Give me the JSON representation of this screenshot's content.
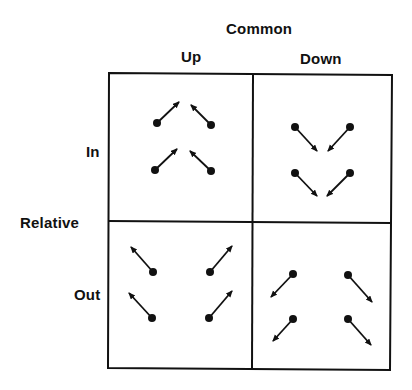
{
  "title": "Common",
  "columns": [
    {
      "label": "Up"
    },
    {
      "label": "Down"
    }
  ],
  "row_axis_label": "Relative",
  "rows": [
    {
      "label": "In"
    },
    {
      "label": "Out"
    }
  ],
  "colors": {
    "ink": "#111111",
    "background": "#ffffff"
  },
  "quadrants": [
    {
      "name": "common-up-relative-in",
      "vectors": [
        {
          "from": [
            157,
            123
          ],
          "to": [
            179,
            102
          ]
        },
        {
          "from": [
            211,
            125
          ],
          "to": [
            191,
            105
          ]
        },
        {
          "from": [
            155,
            170
          ],
          "to": [
            177,
            149
          ]
        },
        {
          "from": [
            211,
            171
          ],
          "to": [
            190,
            151
          ]
        }
      ]
    },
    {
      "name": "common-down-relative-in",
      "vectors": [
        {
          "from": [
            295,
            127
          ],
          "to": [
            317,
            151
          ]
        },
        {
          "from": [
            350,
            127
          ],
          "to": [
            328,
            151
          ]
        },
        {
          "from": [
            295,
            173
          ],
          "to": [
            317,
            196
          ]
        },
        {
          "from": [
            350,
            173
          ],
          "to": [
            327,
            196
          ]
        }
      ]
    },
    {
      "name": "common-up-relative-out",
      "vectors": [
        {
          "from": [
            153,
            272
          ],
          "to": [
            131,
            247
          ]
        },
        {
          "from": [
            210,
            272
          ],
          "to": [
            232,
            246
          ]
        },
        {
          "from": [
            152,
            318
          ],
          "to": [
            129,
            293
          ]
        },
        {
          "from": [
            209,
            318
          ],
          "to": [
            232,
            291
          ]
        }
      ]
    },
    {
      "name": "common-down-relative-out",
      "vectors": [
        {
          "from": [
            293,
            274
          ],
          "to": [
            271,
            297
          ]
        },
        {
          "from": [
            348,
            275
          ],
          "to": [
            372,
            302
          ]
        },
        {
          "from": [
            293,
            319
          ],
          "to": [
            273,
            341
          ]
        },
        {
          "from": [
            348,
            319
          ],
          "to": [
            371,
            345
          ]
        }
      ]
    }
  ]
}
